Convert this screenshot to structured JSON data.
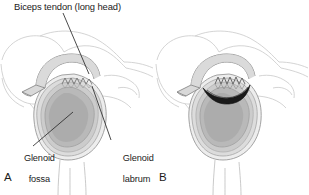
{
  "figure": {
    "kind": "anatomical-illustration",
    "width": 309,
    "height": 195,
    "background_color": "#ffffff",
    "text_color": "#1b1b1b"
  },
  "annotations": {
    "biceps_tendon": "Biceps tendon (long head)",
    "glenoid_fossa_line1": "Glenoid",
    "glenoid_fossa_line2": "fossa",
    "glenoid_labrum_line1": "Glenoid",
    "glenoid_labrum_line2": "labrum"
  },
  "panels": [
    {
      "letter": "A",
      "name": "normal-glenoid",
      "description": "Normal glenoid fossa with intact labrum",
      "has_tear": false
    },
    {
      "letter": "B",
      "name": "torn-labrum-glenoid",
      "description": "Glenoid with detached superior labrum tear",
      "has_tear": true
    }
  ],
  "colors": {
    "outline_faint": "#c9c9c9",
    "outline_light": "#b4b4b4",
    "outline_mid": "#8f8f8f",
    "outline_dark": "#4a4a4a",
    "fossa_fill": "#b9b9b9",
    "fossa_inner_fill": "#a8a8a8",
    "labrum_ring_outer": "#ededed",
    "labrum_ring_mid": "#dcdcdc",
    "labrum_ring_inner": "#cccccc",
    "tendon_fill": "#d4d4d4",
    "tear_fill": "#1a1a1a",
    "leader_line": "#2a2a2a"
  }
}
